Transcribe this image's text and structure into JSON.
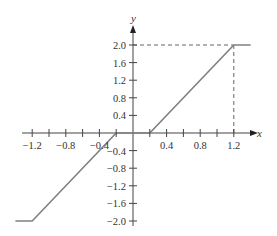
{
  "chart_data": {
    "type": "line",
    "title": "",
    "xlabel": "x",
    "ylabel": "y",
    "xlim": [
      -1.4,
      1.4
    ],
    "ylim": [
      -2.0,
      2.0
    ],
    "grid": false,
    "x_ticks": [
      -1.2,
      -1.0,
      -0.8,
      -0.6,
      -0.4,
      -0.2,
      0.2,
      0.4,
      0.6,
      0.8,
      1.0,
      1.2
    ],
    "x_tick_labels": [
      {
        "value": -1.2,
        "label": "−1.2"
      },
      {
        "value": -0.8,
        "label": "−0.8"
      },
      {
        "value": -0.4,
        "label": "−0.4"
      },
      {
        "value": 0.4,
        "label": "0.4"
      },
      {
        "value": 0.8,
        "label": "0.8"
      },
      {
        "value": 1.2,
        "label": "1.2"
      }
    ],
    "y_tick_labels": [
      {
        "value": 2.0,
        "label": "2.0"
      },
      {
        "value": 1.6,
        "label": "1.6"
      },
      {
        "value": 1.2,
        "label": "1.2"
      },
      {
        "value": 0.8,
        "label": "0.8"
      },
      {
        "value": 0.4,
        "label": "0.4"
      },
      {
        "value": -0.4,
        "label": "−0.4"
      },
      {
        "value": -0.8,
        "label": "−0.8"
      },
      {
        "value": -1.2,
        "label": "−1.2"
      },
      {
        "value": -1.6,
        "label": "−1.6"
      },
      {
        "value": -2.0,
        "label": "−2.0"
      }
    ],
    "series": [
      {
        "name": "dead-zone saturation",
        "x": [
          -1.4,
          -1.2,
          -0.2,
          0.2,
          1.2,
          1.4
        ],
        "y": [
          -2.0,
          -2.0,
          0.0,
          0.0,
          2.0,
          2.0
        ],
        "color": "#808080"
      }
    ],
    "annotations": [
      {
        "type": "dashed-line",
        "from": [
          0,
          2.0
        ],
        "to": [
          1.2,
          2.0
        ]
      },
      {
        "type": "dashed-line",
        "from": [
          1.2,
          0
        ],
        "to": [
          1.2,
          2.0
        ]
      }
    ]
  },
  "labels": {
    "x_axis": "x",
    "y_axis": "y"
  }
}
